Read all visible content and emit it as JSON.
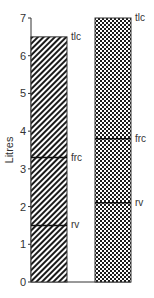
{
  "chart_data": {
    "type": "bar",
    "title": "",
    "xlabel": "",
    "ylabel": "Litres",
    "ylim": [
      0,
      7
    ],
    "yticks": [
      0,
      1,
      2,
      3,
      4,
      5,
      6,
      7
    ],
    "grid": false,
    "legend": "none",
    "categories": [
      "Bar 1 (hatched)",
      "Bar 2 (dotted)"
    ],
    "series": [
      {
        "name": "Bar 1",
        "pattern": "diagonal-hatch",
        "tlc": 6.5,
        "frc": 3.3,
        "rv": 1.5
      },
      {
        "name": "Bar 2",
        "pattern": "dot-checker",
        "tlc": 7.0,
        "frc": 3.8,
        "rv": 2.1
      }
    ],
    "annotations": [
      "tlc",
      "frc",
      "rv"
    ]
  },
  "labels": {
    "ylabel": "Litres",
    "tlc": "tlc",
    "frc": "frc",
    "rv": "rv",
    "ticks": [
      "0",
      "1",
      "2",
      "3",
      "4",
      "5",
      "6",
      "7"
    ]
  }
}
